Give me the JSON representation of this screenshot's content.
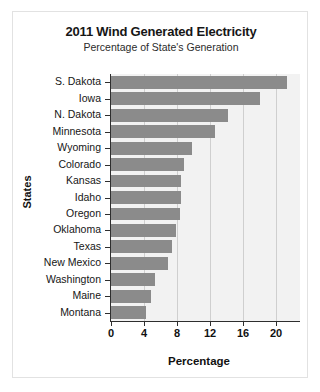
{
  "chart_data": {
    "type": "bar",
    "orientation": "horizontal",
    "title": "2011 Wind Generated Electricity",
    "subtitle": "Percentage of State's Generation",
    "xlabel": "Percentage",
    "ylabel": "States",
    "categories": [
      "S. Dakota",
      "Iowa",
      "N. Dakota",
      "Minnesota",
      "Wyoming",
      "Colorado",
      "Kansas",
      "Idaho",
      "Oregon",
      "Oklahoma",
      "Texas",
      "New Mexico",
      "Washington",
      "Maine",
      "Montana"
    ],
    "values": [
      21.3,
      18.1,
      14.2,
      12.6,
      9.8,
      8.9,
      8.5,
      8.5,
      8.4,
      7.9,
      7.4,
      6.9,
      5.3,
      4.8,
      4.3
    ],
    "xticks": [
      0,
      4,
      8,
      12,
      16,
      20
    ],
    "xlim": [
      0,
      22.9
    ],
    "grid": "vertical",
    "legend": "none",
    "bar_color": "#8b8b8b",
    "plot_background": "#f2f2f2"
  },
  "figure": {
    "frame_color": "#e2e2e2",
    "background": "#ffffff"
  }
}
